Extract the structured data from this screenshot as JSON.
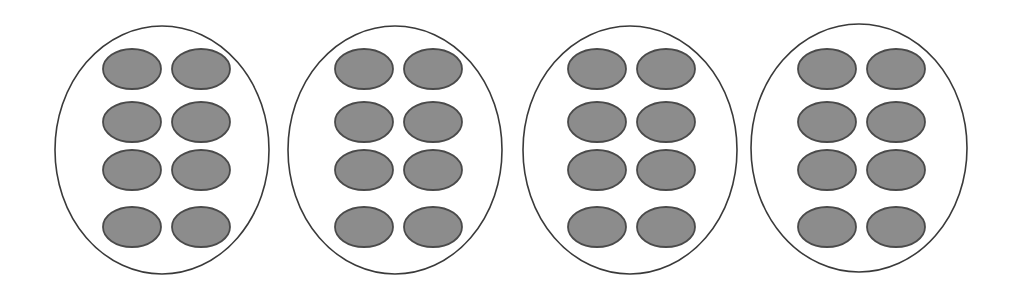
{
  "diagram": {
    "title": "",
    "colors": {
      "background": "#ffffff",
      "group_outline": "#3a3a3a",
      "item_fill": "#8c8c8c",
      "item_stroke": "#4a4a4a"
    },
    "item_size": {
      "rx": 29,
      "ry": 20
    },
    "rows_cy": [
      69,
      122,
      170,
      227
    ],
    "groups": [
      {
        "label": "group-1",
        "cx": 162,
        "cy": 150,
        "rx": 107,
        "ry": 124,
        "item_columns_cx": [
          132,
          201
        ],
        "item_count": 8
      },
      {
        "label": "group-2",
        "cx": 395,
        "cy": 150,
        "rx": 107,
        "ry": 124,
        "item_columns_cx": [
          364,
          433
        ],
        "item_count": 8
      },
      {
        "label": "group-3",
        "cx": 630,
        "cy": 150,
        "rx": 107,
        "ry": 124,
        "item_columns_cx": [
          597,
          666
        ],
        "item_count": 8
      },
      {
        "label": "group-4",
        "cx": 859,
        "cy": 148,
        "rx": 108,
        "ry": 124,
        "item_columns_cx": [
          827,
          896
        ],
        "item_count": 8
      }
    ],
    "totals": {
      "groups": 4,
      "items_per_group": 8,
      "total_items": 32
    }
  }
}
